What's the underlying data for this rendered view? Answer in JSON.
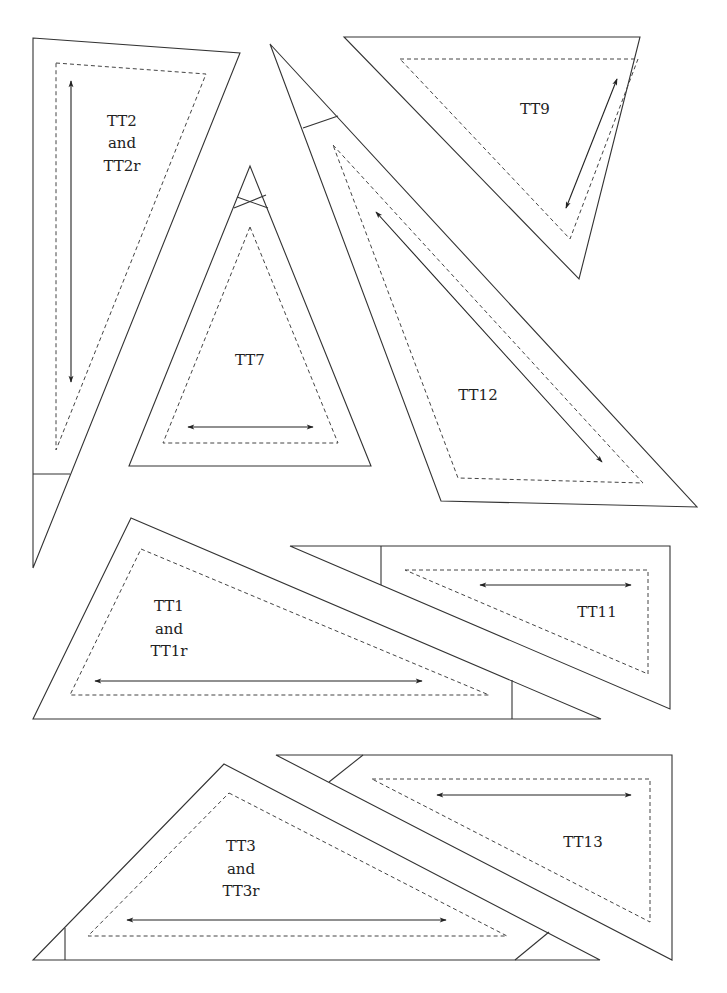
{
  "page": {
    "background": "#ffffff",
    "line_color": "#333333"
  },
  "pieces": [
    {
      "id": "tt2",
      "label_lines": [
        "TT2",
        "and",
        "TT2r"
      ],
      "grainline": "vertical"
    },
    {
      "id": "tt7",
      "label_lines": [
        "TT7"
      ],
      "grainline": "horizontal"
    },
    {
      "id": "tt9",
      "label_lines": [
        "TT9"
      ],
      "grainline": "diagonal"
    },
    {
      "id": "tt12",
      "label_lines": [
        "TT12"
      ],
      "grainline": "diagonal"
    },
    {
      "id": "tt1",
      "label_lines": [
        "TT1",
        "and",
        "TT1r"
      ],
      "grainline": "horizontal"
    },
    {
      "id": "tt11",
      "label_lines": [
        "TT11"
      ],
      "grainline": "horizontal"
    },
    {
      "id": "tt3",
      "label_lines": [
        "TT3",
        "and",
        "TT3r"
      ],
      "grainline": "horizontal"
    },
    {
      "id": "tt13",
      "label_lines": [
        "TT13"
      ],
      "grainline": "horizontal"
    }
  ],
  "legend": {
    "solid_line": "cutting line",
    "dashed_line": "sewing line",
    "double_arrow": "grainline"
  }
}
